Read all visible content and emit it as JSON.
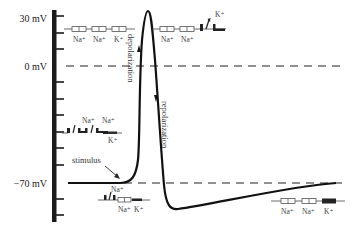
{
  "axis": {
    "labels": [
      {
        "text": "30 mV",
        "y": 18
      },
      {
        "text": "0 mV",
        "y": 66
      },
      {
        "text": "−70 mV",
        "y": 183
      }
    ],
    "tick_count": 13
  },
  "reference_lines": [
    {
      "name": "zero-line",
      "label": "0 mV",
      "y": 66
    },
    {
      "name": "resting-line",
      "label": "−70 mV",
      "y": 183
    }
  ],
  "annotations": {
    "depolarization": "depolarization",
    "repolarization": "repolarization",
    "stimulus": "stimulus"
  },
  "channel_groups": [
    {
      "name": "resting-channels-top",
      "labels": [
        "Na⁺",
        "Na⁺",
        "K⁺"
      ]
    },
    {
      "name": "peak-channels",
      "labels": [
        "Na⁺",
        "Na⁺",
        "K⁺"
      ]
    },
    {
      "name": "depolarization-channels",
      "labels": [
        "Na⁺",
        "Na⁺",
        "K⁺"
      ]
    },
    {
      "name": "threshold-channels",
      "labels": [
        "Na⁺",
        "Na⁺",
        "K⁺"
      ]
    },
    {
      "name": "recovery-channels",
      "labels": [
        "Na⁺",
        "Na⁺",
        "K⁺"
      ]
    }
  ],
  "colors": {
    "curve": "#111111",
    "axis": "#1a1a1a",
    "text": "#333333",
    "dashed": "#222222"
  }
}
